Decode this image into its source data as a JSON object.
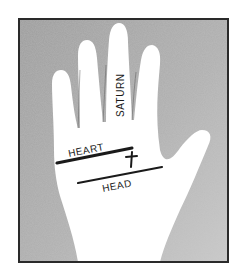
{
  "figure": {
    "labels": {
      "finger_middle": "SATURN",
      "line_upper": "HEART",
      "line_lower": "HEAD"
    },
    "marks": {
      "cross_symbol": "cross"
    },
    "colors": {
      "background": "#ffffff",
      "frame_fill": "#a9a9a9",
      "frame_border": "#2a2a2a",
      "hand": "#ffffff",
      "ink": "#1a1a1a"
    }
  }
}
